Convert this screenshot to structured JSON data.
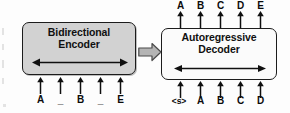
{
  "figure": {
    "name": "encoder-decoder-diagram",
    "background_color": "#fdfdfd",
    "ink_color": "#101010"
  },
  "encoder": {
    "title": "Bidirectional\nEncoder",
    "title_line1": "Bidirectional",
    "title_line2": "Encoder",
    "fill_color": "#d2d2d2",
    "border_color": "#1c1c1c",
    "internal_arrow": "bidirectional-arrow",
    "inputs": [
      "A",
      "_",
      "B",
      "_",
      "E"
    ],
    "outputs": []
  },
  "decoder": {
    "title": "Autoregressive\nDecoder",
    "title_line1": "Autoregressive",
    "title_line2": "Decoder",
    "fill_color": "#fbfbfb",
    "border_color": "#1c1c1c",
    "internal_arrow": "bidirectional-arrow",
    "inputs": [
      "<s>",
      "A",
      "B",
      "C",
      "D"
    ],
    "outputs": [
      "A",
      "B",
      "C",
      "D",
      "E"
    ]
  },
  "transfer": {
    "icon": "block-arrow-right-icon",
    "fill_color": "#b4b4b4",
    "border_color": "#4a4a4a"
  }
}
